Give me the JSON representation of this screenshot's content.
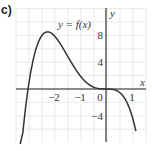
{
  "panel_label": "c)",
  "chart_data": {
    "type": "line",
    "title": "",
    "function_label": "y = f(x)",
    "xlabel": "x",
    "ylabel": "y",
    "xlim": [
      -3.5,
      1.5
    ],
    "ylim": [
      -8,
      10
    ],
    "grid": true,
    "x_ticks": [
      {
        "value": -2,
        "label": "−2"
      },
      {
        "value": -1,
        "label": "−1"
      },
      {
        "value": 0,
        "label": "0"
      },
      {
        "value": 1,
        "label": "1"
      }
    ],
    "y_ticks": [
      {
        "value": 8,
        "label": "8"
      },
      {
        "value": 4,
        "label": "4"
      },
      {
        "value": -4,
        "label": "−4"
      }
    ],
    "series": [
      {
        "name": "y = f(x)",
        "x": [
          -3.3,
          -3.2,
          -3.1,
          -3.0,
          -2.9,
          -2.8,
          -2.7,
          -2.6,
          -2.5,
          -2.4,
          -2.3,
          -2.2,
          -2.1,
          -2.0,
          -1.9,
          -1.8,
          -1.7,
          -1.6,
          -1.5,
          -1.4,
          -1.3,
          -1.2,
          -1.1,
          -1.0,
          -0.9,
          -0.8,
          -0.7,
          -0.6,
          -0.5,
          -0.4,
          -0.3,
          -0.2,
          -0.1,
          0.0,
          0.1,
          0.2,
          0.3,
          0.4,
          0.5,
          0.6,
          0.7,
          0.8,
          0.9,
          1.0,
          1.1,
          1.15
        ],
        "y": [
          -10.78,
          -6.55,
          -2.98,
          0.0,
          2.44,
          4.39,
          5.91,
          7.03,
          7.81,
          8.29,
          8.52,
          8.52,
          8.33,
          8.0,
          7.54,
          6.99,
          6.39,
          5.73,
          5.06,
          4.39,
          3.74,
          3.11,
          2.53,
          2.0,
          1.53,
          1.13,
          0.79,
          0.52,
          0.31,
          0.17,
          0.07,
          0.02,
          0.0,
          0.0,
          -0.0,
          -0.03,
          -0.09,
          -0.22,
          -0.44,
          -0.78,
          -1.26,
          -1.95,
          -2.85,
          -4.0,
          -5.44,
          -6.29
        ]
      }
    ]
  }
}
